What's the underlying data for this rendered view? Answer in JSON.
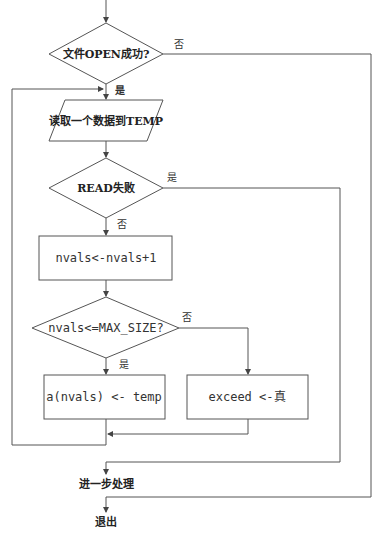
{
  "flowchart": {
    "nodes": {
      "open_check": {
        "type": "decision",
        "label": "文件OPEN成功?"
      },
      "read_input": {
        "type": "io",
        "label": "读取一个数据到TEMP"
      },
      "read_fail": {
        "type": "decision",
        "label": "READ失败"
      },
      "increment": {
        "type": "process",
        "label": "nvals<-nvals+1"
      },
      "size_check": {
        "type": "decision",
        "label": "nvals<=MAX_SIZE?"
      },
      "store": {
        "type": "process",
        "label": "a(nvals) <- temp"
      },
      "exceed": {
        "type": "process",
        "label": "exceed <-真"
      },
      "further": {
        "type": "terminal-text",
        "label": "进一步处理"
      },
      "exit": {
        "type": "terminal-text",
        "label": "退出"
      }
    },
    "branch_labels": {
      "open_no": "否",
      "open_yes": "是",
      "read_fail_yes": "是",
      "read_fail_no": "否",
      "size_no": "否",
      "size_yes": "是"
    },
    "colors": {
      "line": "#555555",
      "text": "#222222",
      "background": "#ffffff"
    }
  }
}
